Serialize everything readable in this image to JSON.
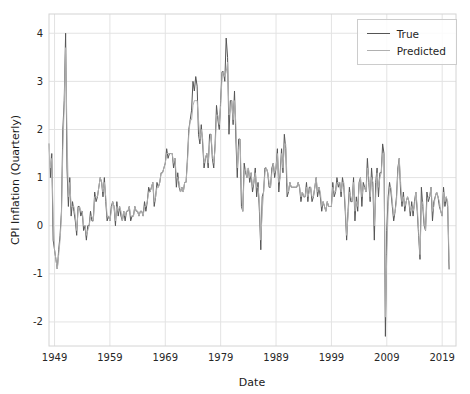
{
  "chart_data": {
    "type": "line",
    "title": "",
    "xlabel": "Date",
    "ylabel": "CPI Inflation (Quarterly)",
    "x_start": 1948.0,
    "x_step_years": 0.25,
    "xlim": [
      1948.0,
      2021.5
    ],
    "ylim": [
      -2.5,
      4.4
    ],
    "xticks": [
      1949,
      1959,
      1969,
      1979,
      1989,
      1999,
      2009,
      2019
    ],
    "yticks": [
      -2,
      -1,
      0,
      1,
      2,
      3,
      4
    ],
    "grid": true,
    "legend": {
      "position": "upper-right"
    },
    "series": [
      {
        "name": "True",
        "color": "#555555",
        "line_width": 1,
        "values": [
          1.7,
          1.0,
          1.5,
          -0.3,
          -0.5,
          -0.7,
          -0.9,
          -0.5,
          -0.2,
          0.3,
          2.0,
          2.6,
          4.0,
          1.2,
          0.4,
          1.0,
          0.2,
          0.5,
          0.3,
          0.1,
          -0.2,
          0.4,
          0.4,
          0.2,
          0.3,
          -0.1,
          0.0,
          -0.3,
          0.0,
          0.0,
          0.3,
          0.1,
          0.1,
          0.7,
          0.5,
          0.6,
          0.8,
          1.0,
          0.9,
          0.6,
          1.0,
          0.5,
          0.1,
          0.2,
          0.1,
          0.4,
          0.5,
          0.4,
          0.0,
          0.5,
          0.2,
          0.4,
          0.2,
          0.1,
          0.3,
          0.1,
          0.3,
          0.3,
          0.4,
          0.1,
          0.2,
          0.2,
          0.4,
          0.3,
          0.3,
          0.2,
          0.3,
          0.3,
          0.2,
          0.5,
          0.3,
          0.5,
          0.8,
          0.7,
          0.8,
          0.9,
          0.4,
          0.6,
          0.9,
          0.8,
          0.9,
          1.1,
          1.1,
          1.2,
          1.3,
          1.6,
          1.4,
          1.5,
          1.5,
          1.5,
          1.2,
          1.4,
          0.8,
          1.1,
          0.8,
          0.7,
          0.8,
          0.7,
          0.9,
          0.9,
          1.4,
          2.0,
          2.2,
          2.4,
          3.0,
          2.8,
          3.1,
          2.9,
          1.9,
          1.7,
          2.1,
          1.7,
          1.2,
          1.4,
          1.5,
          1.2,
          1.9,
          1.9,
          1.4,
          1.2,
          1.7,
          2.5,
          2.2,
          2.0,
          2.6,
          3.2,
          3.2,
          3.0,
          3.9,
          3.5,
          1.9,
          2.6,
          2.6,
          2.1,
          2.8,
          1.8,
          1.0,
          1.8,
          1.8,
          0.4,
          0.3,
          1.3,
          1.1,
          1.0,
          1.2,
          0.9,
          1.1,
          0.7,
          0.9,
          1.2,
          0.6,
          0.9,
          0.3,
          -0.5,
          0.6,
          0.7,
          1.2,
          1.2,
          1.1,
          0.8,
          0.8,
          1.2,
          1.3,
          1.0,
          1.2,
          1.6,
          0.7,
          1.1,
          1.6,
          1.1,
          1.9,
          1.6,
          0.6,
          0.7,
          0.9,
          0.8,
          0.8,
          0.8,
          0.8,
          0.8,
          0.9,
          0.8,
          0.5,
          0.7,
          0.6,
          0.6,
          0.9,
          0.5,
          0.8,
          0.8,
          0.5,
          0.6,
          0.8,
          1.0,
          0.6,
          0.8,
          0.6,
          0.3,
          0.5,
          0.4,
          0.3,
          0.5,
          0.4,
          0.4,
          0.4,
          0.9,
          0.6,
          0.7,
          1.0,
          0.8,
          0.9,
          0.6,
          1.0,
          0.8,
          0.3,
          -0.3,
          0.3,
          0.8,
          0.5,
          0.5,
          1.0,
          0.1,
          0.6,
          0.3,
          0.9,
          1.0,
          0.4,
          0.9,
          0.8,
          0.7,
          1.4,
          0.9,
          0.5,
          1.2,
          0.8,
          -0.3,
          0.9,
          1.2,
          0.6,
          1.1,
          1.1,
          1.7,
          1.5,
          -2.3,
          -0.1,
          0.6,
          0.9,
          0.7,
          0.4,
          0.1,
          0.3,
          0.6,
          1.2,
          1.4,
          0.7,
          0.4,
          0.7,
          0.3,
          0.5,
          0.6,
          0.5,
          0.2,
          0.5,
          0.2,
          0.5,
          0.7,
          0.3,
          -0.2,
          -0.7,
          0.8,
          0.4,
          0.0,
          -0.1,
          0.7,
          0.5,
          0.6,
          0.8,
          0.1,
          0.5,
          0.6,
          0.7,
          0.6,
          0.4,
          0.3,
          0.2,
          0.8,
          0.4,
          0.6,
          0.4,
          -0.9
        ]
      },
      {
        "name": "Predicted",
        "color": "#b0b0b0",
        "line_width": 1,
        "values": [
          1.7,
          1.2,
          1.4,
          0.2,
          -0.5,
          -0.7,
          -0.9,
          -0.6,
          -0.3,
          0.2,
          1.6,
          2.5,
          3.7,
          1.9,
          0.6,
          0.9,
          0.4,
          0.4,
          0.4,
          0.2,
          -0.1,
          0.3,
          0.4,
          0.3,
          0.3,
          0.0,
          0.0,
          -0.2,
          -0.1,
          0.0,
          0.2,
          0.2,
          0.1,
          0.6,
          0.6,
          0.6,
          0.8,
          1.0,
          0.9,
          0.7,
          0.9,
          0.6,
          0.2,
          0.2,
          0.1,
          0.3,
          0.5,
          0.4,
          0.1,
          0.4,
          0.3,
          0.4,
          0.3,
          0.1,
          0.3,
          0.2,
          0.3,
          0.3,
          0.4,
          0.2,
          0.2,
          0.2,
          0.4,
          0.3,
          0.3,
          0.2,
          0.3,
          0.3,
          0.2,
          0.4,
          0.4,
          0.5,
          0.7,
          0.7,
          0.8,
          0.9,
          0.5,
          0.6,
          0.8,
          0.8,
          0.9,
          1.1,
          1.1,
          1.2,
          1.3,
          1.5,
          1.5,
          1.5,
          1.5,
          1.5,
          1.3,
          1.4,
          1.0,
          1.0,
          0.9,
          0.7,
          0.8,
          0.7,
          0.9,
          0.9,
          1.3,
          1.9,
          2.2,
          2.2,
          2.5,
          2.6,
          2.6,
          2.6,
          2.2,
          1.8,
          2.0,
          1.8,
          1.3,
          1.4,
          1.5,
          1.3,
          1.7,
          1.9,
          1.5,
          1.3,
          1.6,
          2.3,
          2.3,
          2.1,
          2.5,
          3.1,
          3.2,
          3.1,
          3.2,
          3.4,
          2.3,
          2.4,
          2.6,
          2.2,
          2.6,
          2.1,
          1.2,
          1.6,
          1.8,
          0.8,
          0.3,
          1.1,
          1.2,
          1.0,
          1.2,
          1.0,
          1.1,
          0.8,
          0.9,
          1.1,
          0.8,
          0.8,
          0.5,
          -0.3,
          0.3,
          0.7,
          1.1,
          1.2,
          1.1,
          0.9,
          0.8,
          1.1,
          1.3,
          1.1,
          1.2,
          1.5,
          0.9,
          1.0,
          1.5,
          1.2,
          1.7,
          1.7,
          0.9,
          0.7,
          0.9,
          0.8,
          0.8,
          0.8,
          0.8,
          0.8,
          0.9,
          0.8,
          0.6,
          0.7,
          0.6,
          0.6,
          0.8,
          0.6,
          0.7,
          0.8,
          0.6,
          0.6,
          0.8,
          1.0,
          0.7,
          0.8,
          0.7,
          0.4,
          0.5,
          0.4,
          0.3,
          0.5,
          0.4,
          0.4,
          0.4,
          0.8,
          0.7,
          0.7,
          0.9,
          0.9,
          0.9,
          0.7,
          0.9,
          0.9,
          0.4,
          -0.2,
          0.2,
          0.7,
          0.6,
          0.5,
          0.9,
          0.3,
          0.5,
          0.4,
          0.8,
          1.0,
          0.6,
          0.8,
          0.8,
          0.7,
          1.2,
          1.0,
          0.6,
          1.0,
          0.9,
          0.0,
          0.6,
          1.1,
          0.8,
          1.0,
          1.1,
          1.5,
          1.5,
          -1.9,
          -0.6,
          0.4,
          0.8,
          0.8,
          0.5,
          0.2,
          0.3,
          0.5,
          1.1,
          1.4,
          0.9,
          0.5,
          0.6,
          0.4,
          0.5,
          0.6,
          0.5,
          0.3,
          0.4,
          0.3,
          0.4,
          0.7,
          0.4,
          -0.1,
          -0.6,
          0.4,
          0.5,
          0.1,
          -0.1,
          0.5,
          0.6,
          0.6,
          0.8,
          0.3,
          0.4,
          0.6,
          0.7,
          0.6,
          0.5,
          0.3,
          0.2,
          0.7,
          0.5,
          0.6,
          0.5,
          -0.7
        ]
      }
    ]
  },
  "style": {
    "background": "#ffffff",
    "grid_color": "#e3e3e3",
    "spine_color": "#d4d4d4",
    "tick_label_color": "#262626",
    "axis_label_color": "#1a1a1a",
    "legend_border": "#cccccc"
  }
}
